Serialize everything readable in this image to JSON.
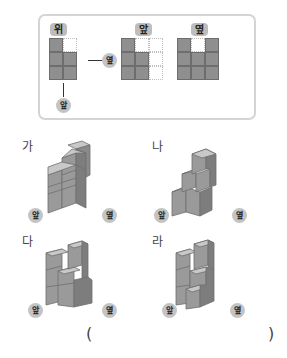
{
  "views_panel": {
    "top_view": {
      "label": "위",
      "grid": [
        [
          1,
          0
        ],
        [
          1,
          1
        ],
        [
          1,
          1
        ]
      ],
      "side_marker": "옆",
      "front_marker": "앞"
    },
    "front_view": {
      "label": "앞",
      "grid": [
        [
          1,
          0,
          0
        ],
        [
          1,
          1,
          0
        ],
        [
          1,
          1,
          0
        ]
      ]
    },
    "side_view": {
      "label": "옆",
      "grid": [
        [
          1,
          0,
          1
        ],
        [
          1,
          1,
          1
        ],
        [
          1,
          1,
          1
        ]
      ]
    }
  },
  "options": [
    {
      "label": "가",
      "front_marker": "앞",
      "side_marker": "옆"
    },
    {
      "label": "나",
      "front_marker": "앞",
      "side_marker": "옆"
    },
    {
      "label": "다",
      "front_marker": "앞",
      "side_marker": "옆"
    },
    {
      "label": "라",
      "front_marker": "앞",
      "side_marker": "옆"
    }
  ],
  "answer": {
    "open": "(",
    "close": ")"
  },
  "colors": {
    "cube_face": "#9a9a9a",
    "cube_top": "#c8c8c8",
    "cube_side": "#7d7d7d",
    "tag_bg": "#bdbdbd"
  }
}
